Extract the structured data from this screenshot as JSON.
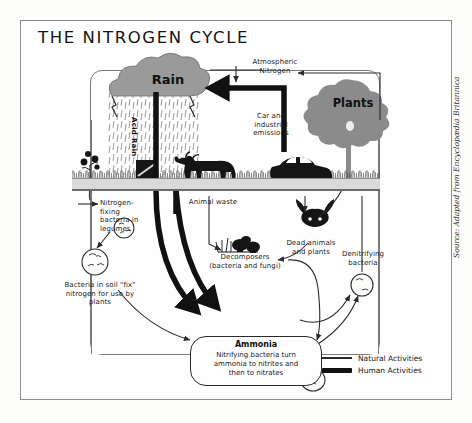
{
  "diagram": {
    "title": "THE NITROGEN CYCLE",
    "source_credit": "Source: Adapted from Encyclopædia Britannica"
  },
  "scene_labels": {
    "rain": "Rain",
    "acid_rain": "Acid Rain",
    "plants": "Plants",
    "atmospheric_nitrogen": "Atmospheric\nNitrogen",
    "atmospheric_nitrogen_line1": "Atmospheric",
    "atmospheric_nitrogen_line2": "Nitrogen",
    "car_emissions_line1": "Car and",
    "car_emissions_line2": "industrial",
    "car_emissions_line3": "emissions",
    "nitrogen_fixing_line1": "Nitrogen-",
    "nitrogen_fixing_line2": "fixing",
    "nitrogen_fixing_line3": "bacteria in",
    "nitrogen_fixing_line4": "legumes",
    "bacteria_soil_line1": "Bacteria in soil \"fix\"",
    "bacteria_soil_line2": "nitrogen for use by",
    "bacteria_soil_line3": "plants",
    "animal_waste": "Animal waste",
    "decomposers_line1": "Decomposers",
    "decomposers_line2": "(bacteria and fungi)",
    "dead_animals_line1": "Dead animals",
    "dead_animals_line2": "and plants",
    "denitrifying_line1": "Denitrifying",
    "denitrifying_line2": "bacteria"
  },
  "ammonia": {
    "title": "Ammonia",
    "body_line1": "Nitrifying bacteria turn",
    "body_line2": "ammonia to nitrites and",
    "body_line3": "then to nitrates"
  },
  "legend": {
    "items": [
      {
        "label": "Natural Activities",
        "style": "thin"
      },
      {
        "label": "Human Activities",
        "style": "thick"
      }
    ]
  },
  "colors": {
    "paper": "#fdfdfc",
    "frame": "#8d8d8d",
    "ink": "#1c1c1c",
    "natural_arrow": "#2b2b2b",
    "human_arrow": "#111111",
    "cloud_gray": "#9a9a9a",
    "tree_gray": "#8b8b8b",
    "ground_gray": "#d9d9d9",
    "silhouette": "#151515"
  }
}
